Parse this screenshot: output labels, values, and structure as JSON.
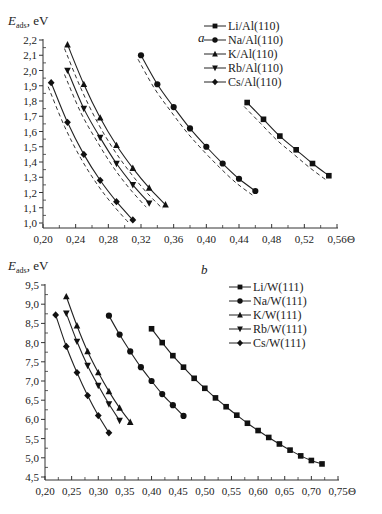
{
  "chart_data": [
    {
      "panel": "a",
      "type": "line",
      "title": "",
      "ylabel": "E_ads, eV",
      "ylabel_main": "E",
      "ylabel_sub": "ads",
      "ylabel_unit": ", eV",
      "xlabel": "Θ",
      "xlim": [
        0.2,
        0.56
      ],
      "ylim": [
        1.0,
        2.2
      ],
      "xticks": [
        0.2,
        0.24,
        0.28,
        0.32,
        0.36,
        0.4,
        0.44,
        0.48,
        0.52,
        0.56
      ],
      "xtick_labels": [
        "0,20",
        "0,24",
        "0,28",
        "0,32",
        "0,36",
        "0,40",
        "0,44",
        "0,48",
        "0,52",
        "0,56"
      ],
      "yticks": [
        1.0,
        1.1,
        1.2,
        1.3,
        1.4,
        1.5,
        1.6,
        1.7,
        1.8,
        1.9,
        2.0,
        2.1,
        2.2
      ],
      "ytick_labels": [
        "1,0",
        "1,1",
        "1,2",
        "1,3",
        "1,4",
        "1,5",
        "1,6",
        "1,7",
        "1,8",
        "1,9",
        "2,0",
        "2,1",
        "2,2"
      ],
      "grid": false,
      "legend_position": "upper right",
      "dashed_reference_curves": true,
      "series": [
        {
          "name": "Li/Al(110)",
          "marker": "square",
          "x": [
            0.45,
            0.47,
            0.49,
            0.51,
            0.53,
            0.55
          ],
          "values": [
            1.79,
            1.68,
            1.57,
            1.48,
            1.39,
            1.31
          ]
        },
        {
          "name": "Na/Al(110)",
          "marker": "circle",
          "x": [
            0.32,
            0.34,
            0.36,
            0.38,
            0.4,
            0.42,
            0.44,
            0.46
          ],
          "values": [
            2.1,
            1.91,
            1.76,
            1.62,
            1.5,
            1.39,
            1.29,
            1.21
          ]
        },
        {
          "name": "K/Al(110)",
          "marker": "triangle-up",
          "x": [
            0.23,
            0.25,
            0.27,
            0.29,
            0.31,
            0.33,
            0.35
          ],
          "values": [
            2.17,
            1.91,
            1.69,
            1.51,
            1.36,
            1.23,
            1.12
          ]
        },
        {
          "name": "Rb/Al(110)",
          "marker": "triangle-down",
          "x": [
            0.23,
            0.25,
            0.27,
            0.29,
            0.31,
            0.33
          ],
          "values": [
            2.0,
            1.75,
            1.56,
            1.39,
            1.25,
            1.13
          ]
        },
        {
          "name": "Cs/Al(110)",
          "marker": "diamond",
          "x": [
            0.21,
            0.23,
            0.25,
            0.27,
            0.29,
            0.31
          ],
          "values": [
            1.92,
            1.66,
            1.45,
            1.28,
            1.14,
            1.02
          ]
        }
      ]
    },
    {
      "panel": "b",
      "type": "line",
      "title": "",
      "ylabel": "E_ads, eV",
      "ylabel_main": "E",
      "ylabel_sub": "ads",
      "ylabel_unit": ", eV",
      "xlabel": "Θ",
      "xlim": [
        0.2,
        0.75
      ],
      "ylim": [
        4.5,
        9.5
      ],
      "xticks": [
        0.2,
        0.25,
        0.3,
        0.35,
        0.4,
        0.45,
        0.5,
        0.55,
        0.6,
        0.65,
        0.7,
        0.75
      ],
      "xtick_labels": [
        "0,20",
        "0,25",
        "0,30",
        "0,35",
        "0,40",
        "0,45",
        "0,50",
        "0,55",
        "0,60",
        "0,65",
        "0,70",
        "0,75"
      ],
      "yticks": [
        4.5,
        5.0,
        5.5,
        6.0,
        6.5,
        7.0,
        7.5,
        8.0,
        8.5,
        9.0,
        9.5
      ],
      "ytick_labels": [
        "4,5",
        "5,0",
        "5,5",
        "6,0",
        "6,5",
        "7,0",
        "7,5",
        "8,0",
        "8,5",
        "9,0",
        "9,5"
      ],
      "grid": false,
      "legend_position": "upper right",
      "dashed_reference_curves": false,
      "series": [
        {
          "name": "Li/W(111)",
          "marker": "square",
          "x": [
            0.4,
            0.42,
            0.44,
            0.46,
            0.48,
            0.5,
            0.52,
            0.54,
            0.56,
            0.58,
            0.6,
            0.62,
            0.64,
            0.66,
            0.68,
            0.7,
            0.72
          ],
          "values": [
            8.36,
            8.0,
            7.66,
            7.36,
            7.07,
            6.81,
            6.56,
            6.33,
            6.11,
            5.9,
            5.71,
            5.53,
            5.36,
            5.2,
            5.05,
            4.93,
            4.84
          ]
        },
        {
          "name": "Na/W(111)",
          "marker": "circle",
          "x": [
            0.32,
            0.34,
            0.36,
            0.38,
            0.4,
            0.42,
            0.44,
            0.46
          ],
          "values": [
            8.7,
            8.21,
            7.77,
            7.36,
            7.0,
            6.66,
            6.37,
            6.09
          ]
        },
        {
          "name": "K/W(111)",
          "marker": "triangle-up",
          "x": [
            0.24,
            0.26,
            0.28,
            0.3,
            0.32,
            0.34,
            0.36
          ],
          "values": [
            9.2,
            8.44,
            7.77,
            7.22,
            6.73,
            6.3,
            5.93
          ]
        },
        {
          "name": "Rb/W(111)",
          "marker": "triangle-down",
          "x": [
            0.24,
            0.26,
            0.28,
            0.3,
            0.32,
            0.34
          ],
          "values": [
            8.76,
            8.03,
            7.4,
            6.88,
            6.4,
            5.97
          ]
        },
        {
          "name": "Cs/W(111)",
          "marker": "diamond",
          "x": [
            0.22,
            0.24,
            0.26,
            0.28,
            0.3,
            0.32
          ],
          "values": [
            8.72,
            7.9,
            7.22,
            6.62,
            6.1,
            5.65
          ]
        }
      ]
    }
  ],
  "layout": {
    "panels": [
      {
        "x0": 43,
        "x1": 337,
        "y_top": 40,
        "y_bottom": 223,
        "axis_y": 228,
        "legend_x": 230,
        "legend_y": 26,
        "label_x": 198,
        "label_y": 42,
        "ytitle_y": 25
      },
      {
        "x0": 45,
        "x1": 338,
        "y_top": 285,
        "y_bottom": 477,
        "axis_y": 480,
        "legend_x": 255,
        "legend_y": 287,
        "label_x": 201,
        "label_y": 274,
        "ytitle_y": 270
      }
    ],
    "colors": {
      "line": "#222222",
      "marker": "#111111",
      "dashed": "#333333",
      "axis": "#333333"
    }
  }
}
